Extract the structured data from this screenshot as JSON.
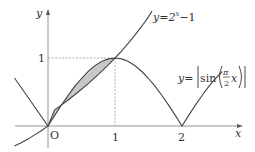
{
  "figure": {
    "title": "",
    "axes": {
      "x_label": "x",
      "y_label": "y",
      "origin_label": "O",
      "x_ticks": [
        "1",
        "2"
      ],
      "y_ticks": [
        "1"
      ]
    },
    "curves": [
      {
        "name": "exponential",
        "label": "y=2^x−1",
        "label_base": "y=2",
        "label_exp": "x",
        "label_tail": "−1"
      },
      {
        "name": "abs-sine",
        "label_prefix": "y=",
        "label_func": "sin",
        "label_frac_num": "π",
        "label_frac_den": "2",
        "label_var": "x"
      }
    ],
    "shaded_region": "area between y=2^x−1 and y=|sin(πx/2)| for 0 ≤ x ≤ 1",
    "colors": {
      "curve": "#444444",
      "axis": "#888888",
      "dashed": "#999999",
      "shade": "#c8c8c8",
      "text": "#333333"
    }
  }
}
